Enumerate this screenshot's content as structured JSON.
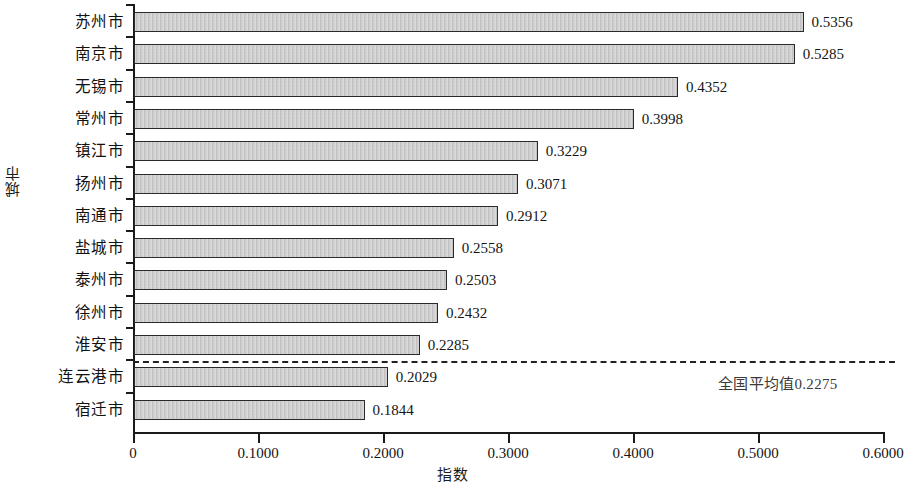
{
  "chart_data": {
    "type": "bar",
    "orientation": "horizontal",
    "title": "",
    "xlabel": "指数",
    "ylabel": "城市",
    "xlim": [
      0,
      0.6
    ],
    "ylim": null,
    "grid": false,
    "legend": null,
    "xticks": [
      "0",
      "0.1000",
      "0.2000",
      "0.3000",
      "0.4000",
      "0.5000",
      "0.6000"
    ],
    "xtick_values": [
      0,
      0.1,
      0.2,
      0.3,
      0.4,
      0.5,
      0.6
    ],
    "categories": [
      "苏州市",
      "南京市",
      "无锡市",
      "常州市",
      "镇江市",
      "扬州市",
      "南通市",
      "盐城市",
      "泰州市",
      "徐州市",
      "淮安市",
      "连云港市",
      "宿迁市"
    ],
    "values": [
      0.5356,
      0.5285,
      0.4352,
      0.3998,
      0.3229,
      0.3071,
      0.2912,
      0.2558,
      0.2503,
      0.2432,
      0.2285,
      0.2029,
      0.1844
    ],
    "value_labels": [
      "0.5356",
      "0.5285",
      "0.4352",
      "0.3998",
      "0.3229",
      "0.3071",
      "0.2912",
      "0.2558",
      "0.2503",
      "0.2432",
      "0.2285",
      "0.2029",
      "0.1844"
    ],
    "annotations": [
      {
        "type": "reference-line",
        "label": "全国平均值0.2275",
        "value": 0.2275,
        "style": "dashed",
        "after_category": "淮安市"
      }
    ],
    "bar_color": "#c9c9c9",
    "bar_border_color": "#2a2a2a",
    "axis_color": "#1a1a1a"
  }
}
